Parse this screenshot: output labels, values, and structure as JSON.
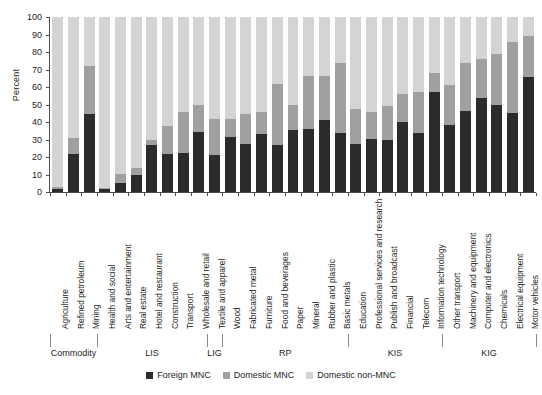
{
  "chart_data": {
    "type": "bar",
    "subtype": "stacked-bar-100",
    "title": "",
    "xlabel": "",
    "ylabel": "Percent",
    "ylim": [
      0,
      100
    ],
    "yticks": [
      0,
      10,
      20,
      30,
      40,
      50,
      60,
      70,
      80,
      90,
      100
    ],
    "grid": false,
    "legend_position": "bottom-center",
    "legend": [
      "Foreign MNC",
      "Domestic MNC",
      "Domestic non-MNC"
    ],
    "colors": {
      "foreign_mnc": "#2b2b2b",
      "domestic_mnc": "#a0a0a0",
      "domestic_non_mnc": "#d4d4d4"
    },
    "categories": [
      "Agriculture",
      "Refined petroleum",
      "Mining",
      "Health and social",
      "Arts and entertainment",
      "Real estate",
      "Hotel and restaurant",
      "Construction",
      "Transport",
      "Wholesale and retail",
      "Textile and apparel",
      "Wood",
      "Fabricated metal",
      "Furniture",
      "Food and beverages",
      "Paper",
      "Mineral",
      "Rubber and plastic",
      "Basic metals",
      "Education",
      "Professional services and research",
      "Publish and broadcast",
      "Financial",
      "Telecom",
      "Information technology",
      "Other transport",
      "Machinery and equipment",
      "Computer and electronics",
      "Chemicals",
      "Electrical equipment",
      "Motor vehicles"
    ],
    "series": [
      {
        "name": "Foreign MNC",
        "color": "#2b2b2b",
        "values": [
          1.5,
          21.5,
          44.5,
          1.5,
          5,
          10,
          27,
          22,
          22.5,
          34.5,
          21,
          31.5,
          27.5,
          33,
          27,
          35.5,
          36,
          41,
          34,
          27.5,
          30.5,
          30,
          40,
          34,
          57,
          38.5,
          46.5,
          53.5,
          49.5,
          45,
          66
        ]
      },
      {
        "name": "Domestic MNC",
        "color": "#a0a0a0",
        "values": [
          1.5,
          9.5,
          27.5,
          1,
          5.5,
          4,
          3,
          16,
          23.5,
          15,
          20.5,
          10,
          17,
          12.5,
          35,
          14,
          30.5,
          25.5,
          39.5,
          20,
          15.5,
          19,
          16,
          23,
          11,
          22.5,
          27.5,
          22.5,
          29.5,
          41,
          23
        ]
      },
      {
        "name": "Domestic non-MNC",
        "color": "#d4d4d4",
        "values": [
          97,
          69,
          28,
          97.5,
          89.5,
          86,
          70,
          62,
          54,
          50.5,
          58.5,
          58.5,
          55.5,
          54.5,
          38,
          50.5,
          33.5,
          33.5,
          26.5,
          52.5,
          54,
          51,
          44,
          43,
          32,
          39,
          26,
          24,
          21,
          14,
          11
        ]
      }
    ],
    "groups": [
      {
        "label": "Commodity",
        "start": 0,
        "end": 2
      },
      {
        "label": "LIS",
        "start": 3,
        "end": 9
      },
      {
        "label": "LIG",
        "start": 10,
        "end": 10
      },
      {
        "label": "RP",
        "start": 11,
        "end": 18
      },
      {
        "label": "KIS",
        "start": 19,
        "end": 24
      },
      {
        "label": "KIG",
        "start": 25,
        "end": 30
      }
    ]
  }
}
